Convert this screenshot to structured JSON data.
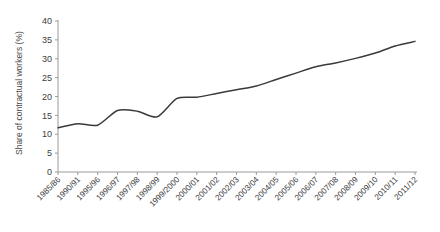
{
  "chart_data": {
    "type": "line",
    "title": "",
    "subtitle": "",
    "xlabel": "",
    "ylabel": "Share of contractual workers (%)",
    "ylim": [
      0,
      40
    ],
    "yticks": [
      0,
      5,
      10,
      15,
      20,
      25,
      30,
      35,
      40
    ],
    "grid": false,
    "legend": false,
    "legend_position": "none",
    "line_color": "#3a3a3a",
    "categories": [
      "1985/86",
      "1990/91",
      "1995/96",
      "1996/97",
      "1997/98",
      "1998/99",
      "1999/2000",
      "2000/01",
      "2001/02",
      "2002/03",
      "2003/04",
      "2004/05",
      "2005/06",
      "2006/07",
      "2007/08",
      "2008/09",
      "2009/10",
      "2010/11",
      "2011/12"
    ],
    "series": [
      {
        "name": "Share of contractual workers (%)",
        "values": [
          11.7,
          12.8,
          12.4,
          16.3,
          16.1,
          14.6,
          19.5,
          19.8,
          20.8,
          21.8,
          22.8,
          24.5,
          26.2,
          27.9,
          28.9,
          30.1,
          31.5,
          33.4,
          34.6
        ]
      }
    ]
  },
  "axis": {
    "y_tick_labels": [
      "40",
      "35",
      "30",
      "25",
      "20",
      "15",
      "10",
      "5",
      "0"
    ],
    "y_axis_title": "Share of contractual workers (%)"
  }
}
